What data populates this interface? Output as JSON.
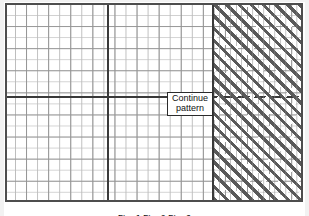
{
  "figure": {
    "type": "coordinate-grid-diagram",
    "frame": {
      "border_color": "#4d4d4d",
      "background_color": "#ffffff"
    },
    "grid": {
      "minor_color": "#c4c4c4",
      "major_color": "#8c8c8c",
      "minor_spacing_px": 11,
      "major_spacing_px": 22,
      "columns": 27,
      "rows": 18
    },
    "axes": {
      "color": "#3a3a3a",
      "x_axis_label": "",
      "y_axis_label": "",
      "origin_x_px": 101,
      "origin_y_px": 92
    },
    "shaded_region": {
      "name": "hatched-region",
      "hatch_color": "#595959",
      "hatch_angle_deg": 45,
      "starts_at_px": 206,
      "boundary_color": "#3a3a3a"
    },
    "callout": {
      "name": "continue-pattern-callout",
      "line1": "Continue",
      "line2": "pattern",
      "border_color": "#2b2b2b",
      "background_color": "#ffffff"
    },
    "caption": {
      "text": "Fig. 1   Fig. 2   Fig. 3",
      "note": "clipped at image bottom edge"
    }
  }
}
